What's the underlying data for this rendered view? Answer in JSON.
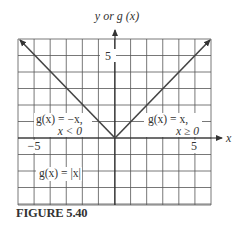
{
  "chart_data": {
    "type": "line",
    "title": "",
    "xlabel": "x",
    "ylabel": "y or g(x)",
    "xlim": [
      -6,
      6
    ],
    "ylim": [
      -4,
      6
    ],
    "grid": true,
    "x_ticks_labeled": [
      -5,
      5
    ],
    "y_ticks_labeled": [
      5
    ],
    "series": [
      {
        "name": "g(x) = -x, x < 0",
        "x": [
          -6,
          0
        ],
        "y": [
          6,
          0
        ],
        "arrow_end": "left"
      },
      {
        "name": "g(x) = x, x ≥ 0",
        "x": [
          0,
          6
        ],
        "y": [
          0,
          6
        ],
        "arrow_end": "right"
      }
    ],
    "annotations": [
      {
        "text": "g(x) = −x,",
        "line2": "x < 0",
        "position": "left-middle"
      },
      {
        "text": "g(x) = x,",
        "line2": "x ≥ 0",
        "position": "right-middle"
      },
      {
        "text": "g(x) = |x|",
        "position": "lower-left"
      }
    ]
  },
  "axes": {
    "y_label": "y or g (x)",
    "x_label": "x",
    "tick_neg5": "−5",
    "tick_pos5_x": "5",
    "tick_pos5_y": "5"
  },
  "annotations": {
    "left_line1": "g(x) = −x,",
    "left_line2": "x < 0",
    "right_line1": "g(x) = x,",
    "right_line2": "x ≥ 0",
    "abs_label": "g(x) = |x|"
  },
  "caption": "FIGURE 5.40"
}
